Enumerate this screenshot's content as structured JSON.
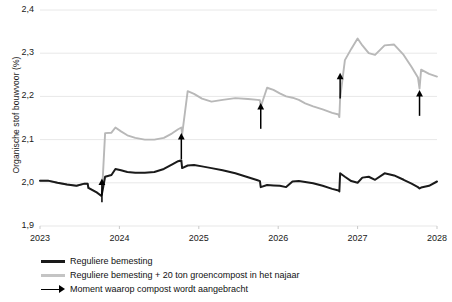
{
  "chart_data": {
    "type": "line",
    "title": "",
    "xlabel": "",
    "ylabel": "Organische stof bouwvoor (%)",
    "ylim": [
      1.9,
      2.4
    ],
    "xlim": [
      2023.0,
      2028.0
    ],
    "grid": true,
    "ytick_labels": [
      "2,4",
      "2,3",
      "2,2",
      "2,1",
      "2,0",
      "1,9"
    ],
    "ytick_values": [
      2.4,
      2.3,
      2.2,
      2.1,
      2.0,
      1.9
    ],
    "xtick_labels": [
      "2023",
      "2024",
      "2025",
      "2026",
      "2027",
      "2028"
    ],
    "xtick_values": [
      2023,
      2024,
      2025,
      2026,
      2027,
      2028
    ],
    "legend_position": "below-left",
    "colors": {
      "series_regular": "#1a1a1a",
      "series_compost": "#b8b8b8",
      "arrow": "#000000",
      "grid": "#e8e8e8",
      "text": "#1a1a1a"
    },
    "annotations": {
      "arrow_label": "Moment waarop compost wordt aangebracht",
      "arrow_x_values": [
        2023.78,
        2024.78,
        2025.78,
        2026.78,
        2027.78
      ],
      "arrow_tip_y": [
        2.01,
        2.115,
        2.185,
        2.255,
        2.215
      ],
      "arrow_tail_y": [
        1.955,
        2.055,
        2.125,
        2.195,
        2.155
      ]
    },
    "series": [
      {
        "name": "Reguliere bemesting",
        "color": "#1a1a1a",
        "x": [
          2023.0,
          2023.1,
          2023.22,
          2023.34,
          2023.46,
          2023.56,
          2023.6,
          2023.61,
          2023.72,
          2023.77,
          2023.78,
          2023.82,
          2023.9,
          2023.95,
          2024.02,
          2024.1,
          2024.2,
          2024.32,
          2024.44,
          2024.56,
          2024.66,
          2024.74,
          2024.78,
          2024.79,
          2024.86,
          2024.94,
          2025.04,
          2025.16,
          2025.3,
          2025.46,
          2025.62,
          2025.74,
          2025.77,
          2025.78,
          2025.86,
          2025.94,
          2026.02,
          2026.1,
          2026.18,
          2026.26,
          2026.34,
          2026.44,
          2026.56,
          2026.68,
          2026.76,
          2026.77,
          2026.78,
          2026.84,
          2026.92,
          2027.0,
          2027.06,
          2027.14,
          2027.22,
          2027.34,
          2027.46,
          2027.58,
          2027.68,
          2027.76,
          2027.78,
          2027.8,
          2027.9,
          2028.0
        ],
        "y": [
          2.005,
          2.005,
          2.0,
          1.996,
          1.993,
          1.998,
          1.998,
          1.988,
          1.977,
          1.97,
          1.974,
          2.014,
          2.018,
          2.032,
          2.029,
          2.025,
          2.023,
          2.023,
          2.025,
          2.032,
          2.042,
          2.05,
          2.052,
          2.034,
          2.04,
          2.041,
          2.038,
          2.034,
          2.029,
          2.022,
          2.013,
          2.006,
          2.004,
          1.99,
          1.995,
          1.994,
          1.993,
          1.99,
          2.003,
          2.004,
          2.002,
          1.999,
          1.993,
          1.986,
          1.982,
          1.98,
          2.022,
          2.014,
          2.004,
          2.0,
          2.012,
          2.014,
          2.007,
          2.022,
          2.017,
          2.007,
          1.998,
          1.99,
          1.987,
          1.989,
          1.993,
          2.003
        ]
      },
      {
        "name": "Reguliere bemesting + 20 ton groencompost in het najaar",
        "color": "#b8b8b8",
        "x": [
          2023.0,
          2023.1,
          2023.22,
          2023.34,
          2023.46,
          2023.56,
          2023.6,
          2023.61,
          2023.72,
          2023.77,
          2023.78,
          2023.82,
          2023.9,
          2023.95,
          2024.02,
          2024.1,
          2024.2,
          2024.32,
          2024.44,
          2024.56,
          2024.66,
          2024.74,
          2024.78,
          2024.79,
          2024.86,
          2024.94,
          2025.04,
          2025.16,
          2025.3,
          2025.46,
          2025.62,
          2025.74,
          2025.77,
          2025.78,
          2025.86,
          2025.94,
          2026.02,
          2026.1,
          2026.18,
          2026.26,
          2026.34,
          2026.44,
          2026.56,
          2026.68,
          2026.76,
          2026.77,
          2026.78,
          2026.84,
          2026.92,
          2027.0,
          2027.06,
          2027.14,
          2027.22,
          2027.34,
          2027.46,
          2027.58,
          2027.68,
          2027.76,
          2027.78,
          2027.8,
          2027.9,
          2028.0
        ],
        "y": [
          2.005,
          2.005,
          2.0,
          1.996,
          1.993,
          1.998,
          1.998,
          1.988,
          1.977,
          1.97,
          1.974,
          2.115,
          2.116,
          2.128,
          2.119,
          2.11,
          2.104,
          2.1,
          2.1,
          2.104,
          2.114,
          2.124,
          2.128,
          2.112,
          2.212,
          2.206,
          2.195,
          2.188,
          2.192,
          2.196,
          2.194,
          2.192,
          2.191,
          2.176,
          2.22,
          2.215,
          2.207,
          2.2,
          2.197,
          2.192,
          2.184,
          2.177,
          2.17,
          2.162,
          2.158,
          2.152,
          2.196,
          2.284,
          2.31,
          2.334,
          2.318,
          2.3,
          2.296,
          2.318,
          2.32,
          2.296,
          2.268,
          2.244,
          2.218,
          2.262,
          2.252,
          2.246
        ]
      }
    ]
  },
  "legend": {
    "items": [
      {
        "label": "Reguliere bemesting",
        "marker": "line-dark"
      },
      {
        "label": "Reguliere bemesting + 20 ton groencompost in het najaar",
        "marker": "line-gray"
      },
      {
        "label": "Moment waarop compost wordt aangebracht",
        "marker": "arrow"
      }
    ]
  }
}
